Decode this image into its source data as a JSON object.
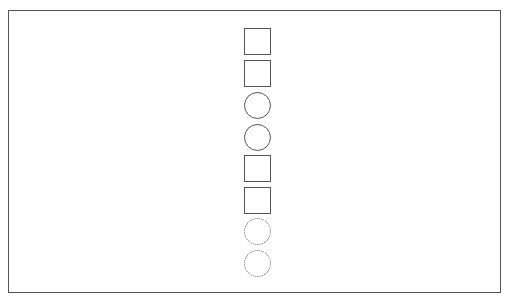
{
  "canvas": {
    "width": 515,
    "height": 303,
    "background": "#ffffff"
  },
  "frame": {
    "left": 8,
    "top": 10,
    "width": 493,
    "height": 283,
    "stroke": "#555555"
  },
  "shapes": [
    {
      "type": "square",
      "style": "solid",
      "top": 28
    },
    {
      "type": "square",
      "style": "solid",
      "top": 60
    },
    {
      "type": "circle",
      "style": "solid",
      "top": 92
    },
    {
      "type": "circle",
      "style": "solid",
      "top": 124
    },
    {
      "type": "square",
      "style": "solid",
      "top": 155
    },
    {
      "type": "square",
      "style": "solid",
      "top": 187
    },
    {
      "type": "circle",
      "style": "dotted",
      "top": 218
    },
    {
      "type": "circle",
      "style": "dotted",
      "top": 250
    }
  ],
  "colors": {
    "stroke": "#555555",
    "dotted_stroke": "#666666"
  }
}
